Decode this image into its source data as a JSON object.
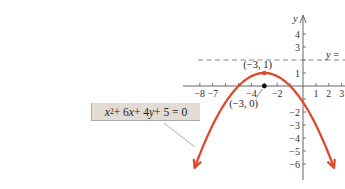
{
  "chart_data": {
    "type": "line",
    "title": "",
    "xlabel": "",
    "ylabel": "y",
    "equation": {
      "parts": [
        "x",
        "2",
        " + 6",
        "x",
        " + 4",
        "y",
        " + 5 = 0"
      ],
      "plain": "x^2 + 6x + 4y + 5 = 0"
    },
    "function": "y = -(x+3)^2/4 + 1",
    "series": [
      {
        "name": "x^2 + 6x + 4y + 5 = 0",
        "color": "#e0492b",
        "x_range": [
          -8.4,
          2.4
        ],
        "vertex": [
          -3,
          1
        ]
      }
    ],
    "x_ticks": [
      -8,
      -7,
      -6,
      -5,
      -4,
      -3,
      -2,
      -1,
      1,
      2,
      3
    ],
    "x_tick_labels": [
      {
        "value": -8,
        "text": "−8"
      },
      {
        "value": -7,
        "text": "−7"
      },
      {
        "value": -4,
        "text": "−4"
      },
      {
        "value": -2,
        "text": "−2"
      },
      {
        "value": 1,
        "text": "1"
      },
      {
        "value": 2,
        "text": "2"
      },
      {
        "value": 3,
        "text": "3"
      }
    ],
    "y_ticks": [
      4,
      3,
      2,
      1,
      -1,
      -2,
      -3,
      -4,
      -5,
      -6
    ],
    "y_tick_labels": [
      {
        "value": 4,
        "text": "4"
      },
      {
        "value": 3,
        "text": "3"
      },
      {
        "value": 1,
        "text": "1"
      },
      {
        "value": -2,
        "text": "−2"
      },
      {
        "value": -3,
        "text": "−3"
      },
      {
        "value": -4,
        "text": "−4"
      },
      {
        "value": -5,
        "text": "−5"
      },
      {
        "value": -6,
        "text": "−6"
      }
    ],
    "directrix": {
      "y": 2,
      "label": "y ="
    },
    "points": [
      {
        "x": -3,
        "y": 1,
        "label": "(−3, 1)",
        "color": "#e0492b"
      },
      {
        "x": -3,
        "y": 0,
        "label": "(−3, 0)",
        "color": "#111111"
      }
    ],
    "xlim": [
      -9.3,
      3.3
    ],
    "ylim": [
      -7,
      5.5
    ],
    "grid": false,
    "legend": "none",
    "colors": {
      "curve": "#e0492b",
      "axes": "#555555",
      "dashed": "#777777",
      "equation_box": "#e2dcd5"
    }
  }
}
